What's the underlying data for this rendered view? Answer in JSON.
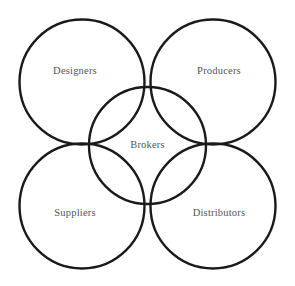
{
  "diagram": {
    "type": "venn-four-outer-one-center",
    "background_color": "#ffffff",
    "stroke_color": "#1a1a1a",
    "stroke_width": 2.4,
    "label_color": "#555555",
    "label_font_size": "10.5px",
    "circles": [
      {
        "id": "designers",
        "label": "Designers",
        "position": "top-left",
        "cx": 82,
        "cy": 82,
        "r": 62.5,
        "label_x": 75,
        "label_y": 72
      },
      {
        "id": "producers",
        "label": "Producers",
        "position": "top-right",
        "cx": 213,
        "cy": 82,
        "r": 62.5,
        "label_x": 219,
        "label_y": 72
      },
      {
        "id": "suppliers",
        "label": "Suppliers",
        "position": "bottom-left",
        "cx": 82,
        "cy": 206,
        "r": 62.5,
        "label_x": 75,
        "label_y": 214
      },
      {
        "id": "distributors",
        "label": "Distributors",
        "position": "bottom-right",
        "cx": 213,
        "cy": 206,
        "r": 62.5,
        "label_x": 219,
        "label_y": 214
      },
      {
        "id": "brokers",
        "label": "Brokers",
        "position": "center",
        "cx": 147.5,
        "cy": 145.5,
        "r": 58.5,
        "label_x": 147.5,
        "label_y": 146
      }
    ]
  }
}
